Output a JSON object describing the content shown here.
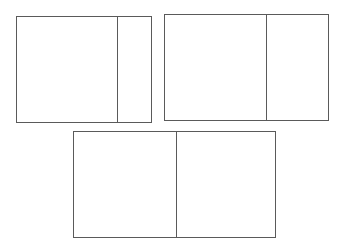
{
  "diagram": {
    "stroke_color": "#5a5a5a",
    "background": "#ffffff",
    "boxes": [
      {
        "id": "box-1",
        "x": 16,
        "y": 16,
        "width": 136,
        "height": 107,
        "divider_x": 100
      },
      {
        "id": "box-2",
        "x": 164,
        "y": 14,
        "width": 165,
        "height": 107,
        "divider_x": 101
      },
      {
        "id": "box-3",
        "x": 73,
        "y": 131,
        "width": 203,
        "height": 107,
        "divider_x": 102
      }
    ]
  }
}
